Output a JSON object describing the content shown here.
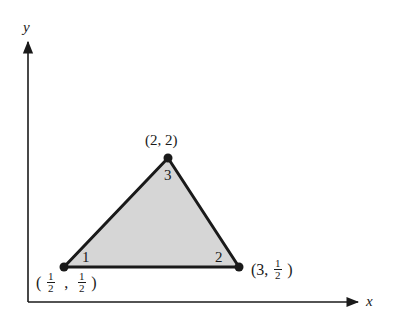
{
  "diagram": {
    "axes": {
      "x_label": "x",
      "y_label": "y"
    },
    "triangle": {
      "fill_color": "#d6d6d6",
      "edge_color": "#1a1a1a",
      "vertices": [
        {
          "local_index": "1",
          "coord_label": {
            "x_num": "1",
            "x_den": "2",
            "y_num": "1",
            "y_den": "2"
          },
          "x": 0.5,
          "y": 0.5
        },
        {
          "local_index": "2",
          "coord_label": {
            "x": "3",
            "y_num": "1",
            "y_den": "2"
          },
          "x": 3,
          "y": 0.5
        },
        {
          "local_index": "3",
          "coord_label": {
            "text": "(2, 2)"
          },
          "x": 2,
          "y": 2
        }
      ]
    },
    "punct": {
      "open": "(",
      "close": ")",
      "comma": ",",
      "v2_prefix": "(3,"
    }
  }
}
